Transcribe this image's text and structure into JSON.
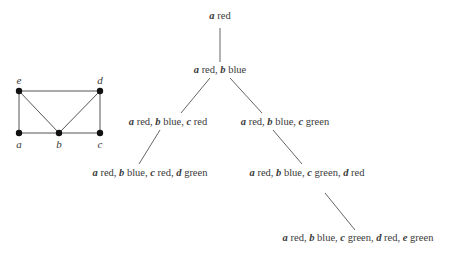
{
  "graph": {
    "vertices": [
      {
        "id": "e",
        "label": "e",
        "x": 19,
        "y": 91,
        "lx": 19,
        "ly": 84
      },
      {
        "id": "d",
        "label": "d",
        "x": 100,
        "y": 91,
        "lx": 100,
        "ly": 84
      },
      {
        "id": "a",
        "label": "a",
        "x": 19,
        "y": 133,
        "lx": 19,
        "ly": 148
      },
      {
        "id": "b",
        "label": "b",
        "x": 59,
        "y": 133,
        "lx": 59,
        "ly": 148
      },
      {
        "id": "c",
        "label": "c",
        "x": 100,
        "y": 133,
        "lx": 100,
        "ly": 148
      }
    ],
    "edges": [
      [
        "e",
        "d"
      ],
      [
        "e",
        "a"
      ],
      [
        "e",
        "b"
      ],
      [
        "a",
        "b"
      ],
      [
        "b",
        "c"
      ],
      [
        "b",
        "d"
      ],
      [
        "d",
        "c"
      ]
    ]
  },
  "tree": {
    "nodes": [
      {
        "id": "n1",
        "x": 220,
        "y": 19,
        "assignments": [
          {
            "var": "a",
            "color": "red"
          }
        ]
      },
      {
        "id": "n2",
        "x": 220,
        "y": 73,
        "assignments": [
          {
            "var": "a",
            "color": "red"
          },
          {
            "var": "b",
            "color": "blue"
          }
        ]
      },
      {
        "id": "n3",
        "x": 168,
        "y": 125,
        "assignments": [
          {
            "var": "a",
            "color": "red"
          },
          {
            "var": "b",
            "color": "blue"
          },
          {
            "var": "c",
            "color": "red"
          }
        ]
      },
      {
        "id": "n4",
        "x": 285,
        "y": 125,
        "assignments": [
          {
            "var": "a",
            "color": "red"
          },
          {
            "var": "b",
            "color": "blue"
          },
          {
            "var": "c",
            "color": "green"
          }
        ]
      },
      {
        "id": "n5",
        "x": 150,
        "y": 176,
        "assignments": [
          {
            "var": "a",
            "color": "red"
          },
          {
            "var": "b",
            "color": "blue"
          },
          {
            "var": "c",
            "color": "red"
          },
          {
            "var": "d",
            "color": "green"
          }
        ]
      },
      {
        "id": "n6",
        "x": 307,
        "y": 176,
        "assignments": [
          {
            "var": "a",
            "color": "red"
          },
          {
            "var": "b",
            "color": "blue"
          },
          {
            "var": "c",
            "color": "green"
          },
          {
            "var": "d",
            "color": "red"
          }
        ]
      },
      {
        "id": "n7",
        "x": 358,
        "y": 241,
        "assignments": [
          {
            "var": "a",
            "color": "red"
          },
          {
            "var": "b",
            "color": "blue"
          },
          {
            "var": "c",
            "color": "green"
          },
          {
            "var": "d",
            "color": "red"
          },
          {
            "var": "e",
            "color": "green"
          }
        ]
      }
    ],
    "edges": [
      {
        "from": "n1",
        "to": "n2",
        "x1": 220,
        "y1": 28,
        "x2": 220,
        "y2": 62
      },
      {
        "from": "n2",
        "to": "n3",
        "x1": 210,
        "y1": 78,
        "x2": 181,
        "y2": 113
      },
      {
        "from": "n2",
        "to": "n4",
        "x1": 230,
        "y1": 78,
        "x2": 262,
        "y2": 113
      },
      {
        "from": "n3",
        "to": "n5",
        "x1": 160,
        "y1": 130,
        "x2": 139,
        "y2": 164
      },
      {
        "from": "n4",
        "to": "n6",
        "x1": 273,
        "y1": 130,
        "x2": 302,
        "y2": 164
      },
      {
        "from": "n6",
        "to": "n7",
        "x1": 325,
        "y1": 193,
        "x2": 355,
        "y2": 230
      }
    ]
  }
}
